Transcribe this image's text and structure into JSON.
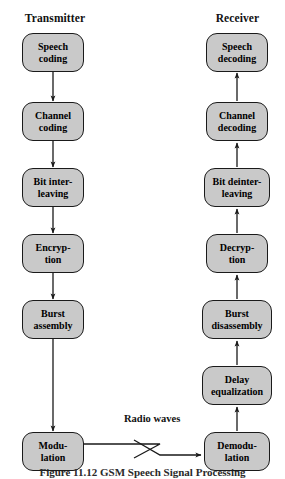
{
  "figure": {
    "caption": "Figure 11.12   GSM Speech Signal Processing",
    "background_color": "#ffffff",
    "node_fill_color": "#c9c9c9",
    "node_border_color": "#1a1a1a",
    "arrow_color": "#1a1a1a"
  },
  "columns": {
    "transmitter": {
      "heading": "Transmitter",
      "flow_direction": "downward",
      "nodes": [
        {
          "id": "speech-coding",
          "line1": "Speech",
          "line2": "coding",
          "x": 22,
          "y": 33,
          "w": 62,
          "h": 39
        },
        {
          "id": "channel-coding",
          "line1": "Channel",
          "line2": "coding",
          "x": 22,
          "y": 102,
          "w": 62,
          "h": 39
        },
        {
          "id": "bit-interleaving",
          "line1": "Bit inter-",
          "line2": "leaving",
          "x": 22,
          "y": 168,
          "w": 62,
          "h": 39
        },
        {
          "id": "encryption",
          "line1": "Encryp-",
          "line2": "tion",
          "x": 22,
          "y": 234,
          "w": 62,
          "h": 39
        },
        {
          "id": "burst-assembly",
          "line1": "Burst",
          "line2": "assembly",
          "x": 22,
          "y": 300,
          "w": 62,
          "h": 39
        },
        {
          "id": "modulation",
          "line1": "Modu-",
          "line2": "lation",
          "x": 22,
          "y": 432,
          "w": 62,
          "h": 39
        }
      ]
    },
    "receiver": {
      "heading": "Receiver",
      "flow_direction": "upward",
      "nodes": [
        {
          "id": "speech-decoding",
          "line1": "Speech",
          "line2": "decoding",
          "x": 206,
          "y": 33,
          "w": 62,
          "h": 39
        },
        {
          "id": "channel-decoding",
          "line1": "Channel",
          "line2": "decoding",
          "x": 206,
          "y": 102,
          "w": 62,
          "h": 39
        },
        {
          "id": "bit-deinterleaving",
          "line1": "Bit deinter-",
          "line2": "leaving",
          "x": 204,
          "y": 168,
          "w": 66,
          "h": 39
        },
        {
          "id": "decryption",
          "line1": "Decryp-",
          "line2": "tion",
          "x": 206,
          "y": 234,
          "w": 62,
          "h": 39
        },
        {
          "id": "burst-disassembly",
          "line1": "Burst",
          "line2": "disassembly",
          "x": 202,
          "y": 300,
          "w": 70,
          "h": 39
        },
        {
          "id": "delay-equalization",
          "line1": "Delay",
          "line2": "equalization",
          "x": 202,
          "y": 366,
          "w": 70,
          "h": 39
        },
        {
          "id": "demodulation",
          "line1": "Demodu-",
          "line2": "lation",
          "x": 204,
          "y": 432,
          "w": 66,
          "h": 39
        }
      ]
    }
  },
  "link": {
    "label": "Radio waves",
    "label_x": 124,
    "label_y": 419,
    "from": "modulation",
    "to": "demodulation",
    "style": "zigzag-radio-link"
  }
}
